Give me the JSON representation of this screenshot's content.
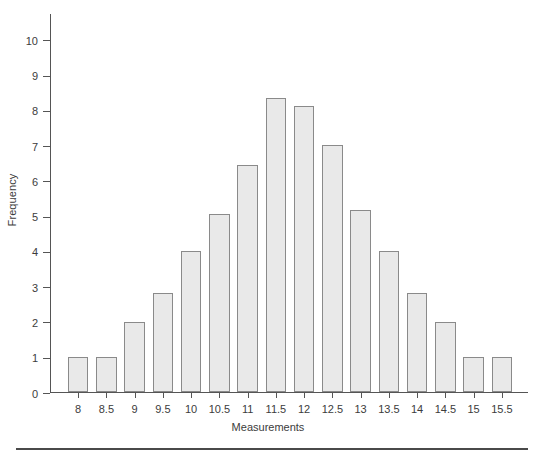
{
  "chart_data": {
    "type": "bar",
    "title": "",
    "xlabel": "Measurements",
    "ylabel": "Frequency",
    "categories": [
      "8",
      "8.5",
      "9",
      "9.5",
      "10",
      "10.5",
      "11",
      "11.5",
      "12",
      "12.5",
      "13",
      "13.5",
      "14",
      "14.5",
      "15",
      "15.5"
    ],
    "values": [
      1,
      1,
      2,
      2.8,
      4,
      5.05,
      6.45,
      8.35,
      8.1,
      7,
      5.15,
      4,
      2.8,
      2,
      1,
      1
    ],
    "xlim": [
      7.75,
      15.75
    ],
    "ylim": [
      0,
      10.75
    ],
    "ytick_labels": [
      "0",
      "1",
      "2",
      "3",
      "4",
      "5",
      "6",
      "7",
      "8",
      "9",
      "10"
    ],
    "ytick_values": [
      0,
      1,
      2,
      3,
      4,
      5,
      6,
      7,
      8,
      9,
      10
    ],
    "grid": false,
    "legend": null,
    "bar_fill_color": "#e9e9e9",
    "bar_border_color": "#8a8a8a",
    "axis_color": "#555555",
    "background_color": "#ffffff"
  },
  "figure": {
    "bottom_rule": ""
  }
}
